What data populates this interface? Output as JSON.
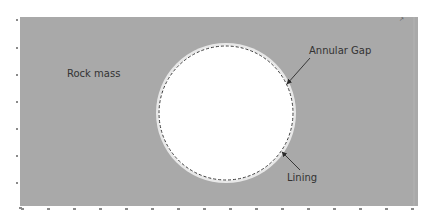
{
  "diagram": {
    "type": "tunnel cross-section",
    "background_color": "#ffffff",
    "domain_color": "#a9a9a9",
    "opening_color": "#ffffff",
    "gap_ring_color": "#e6e6e6",
    "lining_color": "#3a3a3a",
    "arrow_color": "#2a2a2a",
    "plot_area": {
      "x": 20,
      "y": 17,
      "width": 398,
      "height": 189
    },
    "tunnel": {
      "cx": 226,
      "cy": 113,
      "outer_radius": 70,
      "lining_radius": 67
    },
    "labels": {
      "rock_mass": "Rock mass",
      "annular_gap": "Annular Gap",
      "lining": "Lining",
      "axis_indicator": "y\nx"
    },
    "arrows": {
      "annular_gap": {
        "x1": 310,
        "y1": 58,
        "x2": 287,
        "y2": 84
      },
      "lining": {
        "x1": 300,
        "y1": 170,
        "x2": 282,
        "y2": 152
      }
    },
    "x_ticks_count": 16,
    "y_ticks_count": 8
  }
}
